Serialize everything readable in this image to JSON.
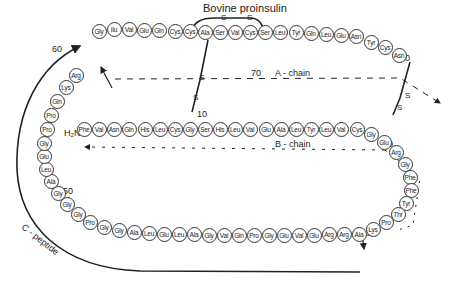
{
  "title": "Bovine proinsulin",
  "labels": {
    "a_chain": "A - chain",
    "b_chain": "B - chain",
    "c_peptide": "C - peptide",
    "n_terminus": "H₂N-",
    "num_10": "10",
    "num_20": "20",
    "num_30": "30",
    "num_40": "40",
    "num_50": "50",
    "num_60": "60",
    "num_70": "70",
    "num_80": "80",
    "sulfur": "S"
  },
  "b_chain": [
    "Phe",
    "Val",
    "Asn",
    "Gln",
    "His",
    "Leu",
    "Cys",
    "Gly",
    "Ser",
    "His",
    "Leu",
    "Val",
    "Glu",
    "Ala",
    "Leu",
    "Tyr",
    "Leu",
    "Val",
    "Cys",
    "Gly",
    "Glu",
    "Arg",
    "Gly",
    "Phe",
    "Phe",
    "Tyr",
    "Thr",
    "Pro",
    "Lys",
    "Ala"
  ],
  "c_peptide": [
    "Arg",
    "Arg",
    "Glu",
    "Val",
    "Glu",
    "Gly",
    "Pro",
    "Gln",
    "Val",
    "Gly",
    "Ala",
    "Leu",
    "Glu",
    "Leu",
    "Ala",
    "Gly",
    "Gly",
    "Pro",
    "Gly",
    "Gly",
    "Gly",
    "Ala",
    "Leu",
    "Glu",
    "Gly",
    "Pro",
    "Pro",
    "Gln",
    "Lys",
    "Arg"
  ],
  "a_chain": [
    "Gly",
    "Ilu",
    "Val",
    "Glu",
    "Gln",
    "Cys",
    "Cys",
    "Ala",
    "Ser",
    "Val",
    "Cys",
    "Ser",
    "Leu",
    "Tyr",
    "Gln",
    "Leu",
    "Glu",
    "Asn",
    "Tyr",
    "Cys",
    "Asn"
  ],
  "disulfide_bonds": [
    {
      "from": "A6 Cys",
      "to": "A11 Cys"
    },
    {
      "from": "A7 Cys",
      "to": "B7 Cys"
    },
    {
      "from": "A20 Cys",
      "to": "B19 Cys"
    }
  ]
}
